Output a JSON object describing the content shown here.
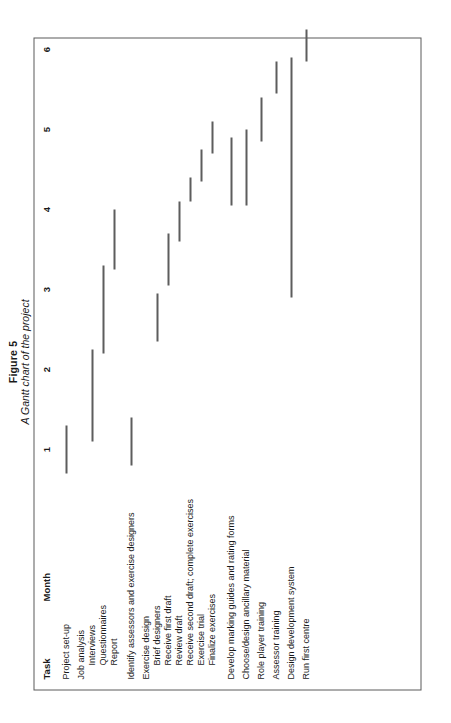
{
  "figure": {
    "title": "Figure 5",
    "subtitle": "A Gantt chart of the project"
  },
  "headers": {
    "task": "Task",
    "month": "Month"
  },
  "chart_data": {
    "type": "bar",
    "orientation": "horizontal-gantt",
    "title": "A Gantt chart of the project",
    "xlabel": "Month",
    "ylabel": "Task",
    "xlim": [
      0,
      6.6
    ],
    "xticks": [
      1,
      2,
      3,
      4,
      5,
      6
    ],
    "xtick_labels": [
      "1",
      "2",
      "3",
      "4",
      "5",
      "6"
    ],
    "grid": false,
    "legend": null,
    "bar_color": "#5d5d5d",
    "tasks": [
      {
        "label": "Project set-up",
        "indent": 0,
        "start": 0.7,
        "end": 1.3
      },
      {
        "label": "Job analysis",
        "indent": 0,
        "start": null,
        "end": null
      },
      {
        "label": "Interviews",
        "indent": 1,
        "start": 1.1,
        "end": 2.25
      },
      {
        "label": "Questionnaires",
        "indent": 1,
        "start": 2.2,
        "end": 3.3
      },
      {
        "label": "Report",
        "indent": 1,
        "start": 3.25,
        "end": 4.0
      },
      {
        "label": "Identify assessors and exercise designers",
        "indent": 0,
        "start": 0.8,
        "end": 1.4
      },
      {
        "label": "Exercise design",
        "indent": 0,
        "start": null,
        "end": null
      },
      {
        "label": "Brief designers",
        "indent": 1,
        "start": 2.35,
        "end": 2.95
      },
      {
        "label": "Receive first draft",
        "indent": 1,
        "start": 3.05,
        "end": 3.7
      },
      {
        "label": "Review draft",
        "indent": 1,
        "start": 3.6,
        "end": 4.1
      },
      {
        "label": "Receive second draft; complete exercises",
        "indent": 1,
        "start": 4.1,
        "end": 4.4
      },
      {
        "label": "Exercise trial",
        "indent": 1,
        "start": 4.35,
        "end": 4.75
      },
      {
        "label": "Finalize exercises",
        "indent": 1,
        "start": 4.7,
        "end": 5.1
      },
      {
        "label": "Develop marking guides and rating forms",
        "indent": 0,
        "start": 4.05,
        "end": 4.9
      },
      {
        "label": "Choose/design ancillary material",
        "indent": 0,
        "start": 4.05,
        "end": 5.0
      },
      {
        "label": "Role player training",
        "indent": 0,
        "start": 4.85,
        "end": 5.4
      },
      {
        "label": "Assessor training",
        "indent": 0,
        "start": 5.45,
        "end": 5.85
      },
      {
        "label": "Design development system",
        "indent": 0,
        "start": 2.9,
        "end": 5.9
      },
      {
        "label": "Run first centre",
        "indent": 0,
        "start": 5.85,
        "end": 6.25
      }
    ]
  }
}
